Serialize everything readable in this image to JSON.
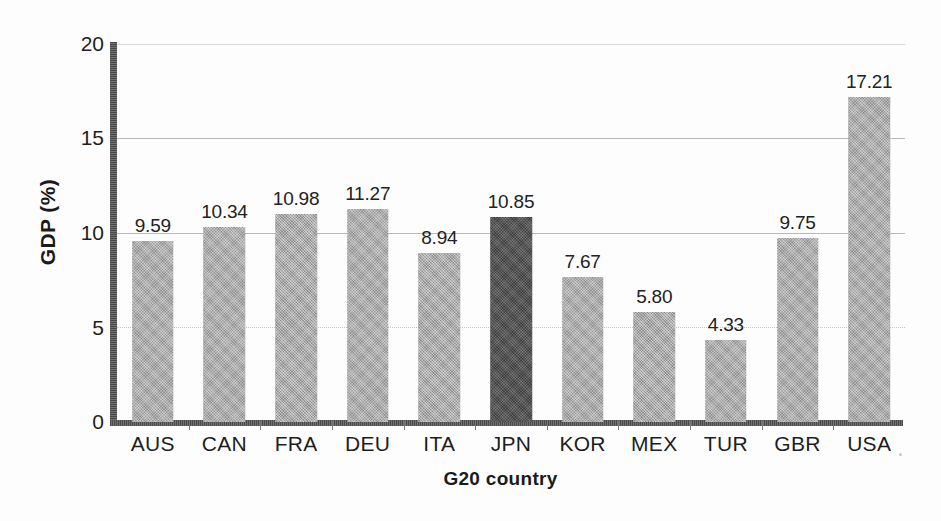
{
  "chart_data": {
    "type": "bar",
    "title": "",
    "subtitle": "",
    "xlabel": "G20 country",
    "ylabel": "GDP (%)",
    "categories": [
      "AUS",
      "CAN",
      "FRA",
      "DEU",
      "ITA",
      "JPN",
      "KOR",
      "MEX",
      "TUR",
      "GBR",
      "USA"
    ],
    "values": [
      9.59,
      10.34,
      10.98,
      11.27,
      8.94,
      10.85,
      7.67,
      5.8,
      4.33,
      9.75,
      17.21
    ],
    "value_labels": [
      "9.59",
      "10.34",
      "10.98",
      "11.27",
      "8.94",
      "10.85",
      "7.67",
      "5.80",
      "4.33",
      "9.75",
      "17.21"
    ],
    "ylim": [
      0,
      20
    ],
    "yticks": [
      0,
      5,
      10,
      15,
      20
    ],
    "ytick_labels": [
      "0",
      "5",
      "10",
      "15",
      "20"
    ],
    "grid": true,
    "legend": "none",
    "highlight_category": "JPN",
    "colors": {
      "bar": "#9e9e9e",
      "bar_highlight": "#4a4a4a",
      "axis": "#5a5a5a",
      "grid": "#b9b9b9",
      "text": "#1e1e1e",
      "background": "#ffffff"
    }
  }
}
